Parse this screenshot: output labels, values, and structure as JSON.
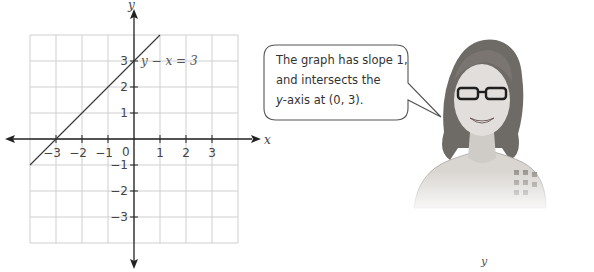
{
  "chart_data": {
    "type": "line",
    "title": "",
    "xlabel": "x",
    "ylabel": "y",
    "x_tick_labels": [
      "−3",
      "−2",
      "−1",
      "0",
      "1",
      "2",
      "3"
    ],
    "y_tick_labels": [
      "3",
      "2",
      "1",
      "−1",
      "−2",
      "−3"
    ],
    "xlim": [
      -4,
      4
    ],
    "ylim": [
      -4,
      4
    ],
    "grid": true,
    "series": [
      {
        "name": "y − x = 3",
        "x": [
          -4,
          1
        ],
        "y": [
          -1,
          4
        ]
      }
    ],
    "annotations": [
      {
        "text": "y − x = 3",
        "x": 0.2,
        "y": 3
      }
    ]
  },
  "graph": {
    "axis_x_label": "x",
    "axis_y_label": "y",
    "origin_label": "0",
    "x_ticks": [
      {
        "label": "−3",
        "value": -3
      },
      {
        "label": "−2",
        "value": -2
      },
      {
        "label": "−1",
        "value": -1
      },
      {
        "label": "1",
        "value": 1
      },
      {
        "label": "2",
        "value": 2
      },
      {
        "label": "3",
        "value": 3
      }
    ],
    "y_ticks": [
      {
        "label": "3",
        "value": 3
      },
      {
        "label": "2",
        "value": 2
      },
      {
        "label": "1",
        "value": 1
      },
      {
        "label": "−1",
        "value": -1
      },
      {
        "label": "−2",
        "value": -2
      },
      {
        "label": "−3",
        "value": -3
      }
    ],
    "equation_label": "y − x = 3",
    "colors": {
      "grid": "#cfcfcf",
      "axis": "#222222",
      "line": "#333333",
      "text": "#444444"
    }
  },
  "speech_bubble": {
    "line1": "The graph has slope 1,",
    "line2": "and intersects the",
    "line3_italic": "y",
    "line3_rest": "-axis at (0, 3)."
  },
  "person": {
    "icon": "student-avatar-icon",
    "description": "Smiling student with glasses"
  },
  "footer": {
    "variable": "y"
  }
}
